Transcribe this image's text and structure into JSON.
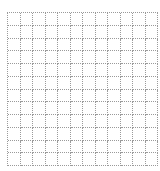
{
  "grid": {
    "rows": 12,
    "columns": 12,
    "line_color": "#9a9a9a",
    "background": "#ffffff",
    "line_style": "dotted"
  }
}
